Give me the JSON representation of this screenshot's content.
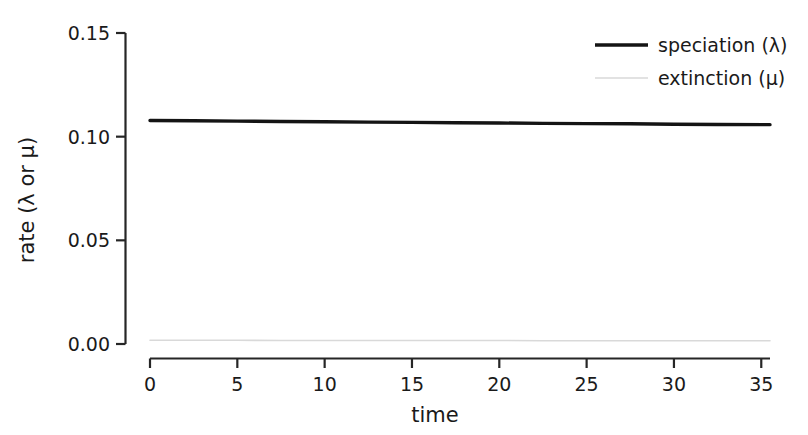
{
  "chart_data": {
    "type": "line",
    "title": "",
    "subtitle": "",
    "xlabel": "time",
    "ylabel": "rate (λ or μ)",
    "xlim": [
      0,
      35.5
    ],
    "ylim": [
      0,
      0.15
    ],
    "xticks": [
      0,
      5,
      10,
      15,
      20,
      25,
      30,
      35
    ],
    "xticklabels": [
      "0",
      "5",
      "10",
      "15",
      "20",
      "25",
      "30",
      "35"
    ],
    "yticks": [
      0.0,
      0.05,
      0.1,
      0.15
    ],
    "yticklabels": [
      "0.00",
      "0.05",
      "0.10",
      "0.15"
    ],
    "grid": false,
    "legend_position": "top-right",
    "background": "#ffffff",
    "series": [
      {
        "name": "speciation (λ)",
        "color": "#141414",
        "linewidth": 3.4,
        "x": [
          0,
          2.5,
          5,
          7.5,
          10,
          12.5,
          15,
          17.5,
          20,
          22.5,
          25,
          27.5,
          30,
          32.5,
          35.5
        ],
        "values": [
          0.1078,
          0.1077,
          0.1075,
          0.1073,
          0.1072,
          0.107,
          0.1069,
          0.1067,
          0.1066,
          0.1064,
          0.1063,
          0.1062,
          0.106,
          0.1059,
          0.1058
        ]
      },
      {
        "name": "extinction (μ)",
        "color": "#d9d9d9",
        "linewidth": 1.6,
        "x": [
          0,
          2.5,
          5,
          7.5,
          10,
          12.5,
          15,
          17.5,
          20,
          22.5,
          25,
          27.5,
          30,
          32.5,
          35.5
        ],
        "values": [
          0.0018,
          0.0018,
          0.0018,
          0.0017,
          0.0017,
          0.0017,
          0.0017,
          0.0017,
          0.0017,
          0.0016,
          0.0016,
          0.0016,
          0.0016,
          0.0016,
          0.0016
        ]
      }
    ]
  },
  "axes": {
    "x_title": "time",
    "y_title": "rate (λ or μ)",
    "x_tick_labels": [
      "0",
      "5",
      "10",
      "15",
      "20",
      "25",
      "30",
      "35"
    ],
    "y_tick_labels": [
      "0.00",
      "0.05",
      "0.10",
      "0.15"
    ]
  },
  "legend": {
    "entries": [
      {
        "label": "speciation (λ)",
        "color": "#141414"
      },
      {
        "label": "extinction (μ)",
        "color": "#d9d9d9"
      }
    ]
  },
  "colors": {
    "speciation": "#141414",
    "extinction": "#d9d9d9",
    "axis": "#262626",
    "text": "#1a1a1a",
    "background": "#ffffff"
  }
}
